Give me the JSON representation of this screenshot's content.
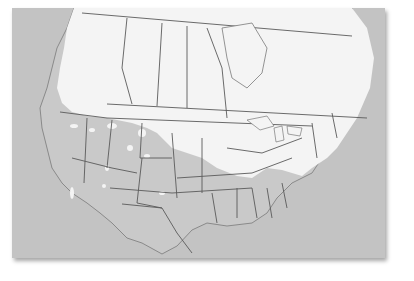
{
  "map": {
    "region": "North America",
    "style": "grayscale range map",
    "colors": {
      "background": "#ffffff",
      "ocean_and_outside_range": "#c3c3c3",
      "range_highlight": "#f4f4f4",
      "borders": "#5a5a5a",
      "coastline": "#7a7a7a"
    },
    "legend": null,
    "labels": []
  }
}
